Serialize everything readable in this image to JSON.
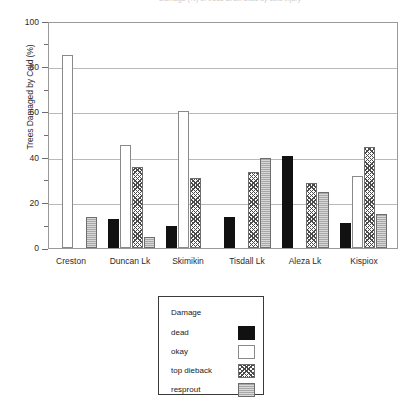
{
  "chart_data": {
    "type": "bar",
    "title": "Damage (%) of trees at six sites by cold injury",
    "xlabel": "",
    "ylabel": "Trees Damaged by Cold (%)",
    "ylim": [
      0,
      100
    ],
    "yticks": [
      0,
      20,
      40,
      60,
      80,
      100
    ],
    "ytick_labels": [
      "0",
      "20",
      "40",
      "60",
      "80",
      "100"
    ],
    "grid": true,
    "legend_position": "below-plot",
    "legend_title": "Damage",
    "categories": [
      "Creston",
      "Duncan Lk",
      "Skimikin",
      "Tisdall Lk",
      "Aleza Lk",
      "Kispiox"
    ],
    "series": [
      {
        "name": "dead",
        "color": "#111111",
        "pattern": "solid-black",
        "values": [
          0,
          13,
          10,
          14,
          41,
          11
        ]
      },
      {
        "name": "okay",
        "color": "#ffffff",
        "pattern": "open-white",
        "values": [
          86,
          46,
          61,
          0,
          0,
          32
        ]
      },
      {
        "name": "top dieback",
        "color": "#4a4a4a",
        "pattern": "crosshatch",
        "values": [
          0,
          36,
          31,
          34,
          29,
          45
        ]
      },
      {
        "name": "resprout",
        "color": "#a8a8a8",
        "pattern": "solid-gray",
        "values": [
          14,
          5,
          0,
          40,
          25,
          15
        ]
      }
    ]
  },
  "axis": {
    "y_title": "Trees Damaged by Cold (%)",
    "y_labels": [
      "100",
      "80",
      "60",
      "40",
      "20",
      "0"
    ],
    "x_labels": [
      "Creston",
      "Duncan Lk",
      "Skimikin",
      "Tisdall Lk",
      "Aleza Lk",
      "Kispiox"
    ]
  },
  "legend": {
    "title": "Damage",
    "items": [
      {
        "label": "dead"
      },
      {
        "label": "okay"
      },
      {
        "label": "top dieback"
      },
      {
        "label": "resprout"
      }
    ]
  }
}
